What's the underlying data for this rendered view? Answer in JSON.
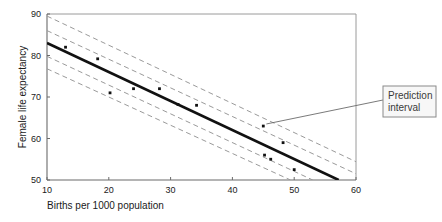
{
  "chart_data": {
    "type": "scatter",
    "title": "",
    "xlabel": "Births per 1000 population",
    "ylabel": "Female life expectancy",
    "xlim": [
      10,
      60
    ],
    "ylim": [
      50,
      90
    ],
    "xticks": [
      10,
      20,
      30,
      40,
      50,
      60
    ],
    "xtick_labels": [
      "10",
      "20",
      "30",
      "40",
      "50",
      "60"
    ],
    "yticks": [
      50,
      60,
      70,
      80,
      90
    ],
    "ytick_labels": [
      "50",
      "60",
      "70",
      "80",
      "90"
    ],
    "grid": false,
    "legend_position": "none",
    "points": [
      {
        "x": 13.0,
        "y": 82.0
      },
      {
        "x": 18.2,
        "y": 79.2
      },
      {
        "x": 20.2,
        "y": 71.0
      },
      {
        "x": 24.0,
        "y": 72.0
      },
      {
        "x": 28.2,
        "y": 72.0
      },
      {
        "x": 31.2,
        "y": 68.2
      },
      {
        "x": 34.2,
        "y": 68.0
      },
      {
        "x": 45.0,
        "y": 63.0
      },
      {
        "x": 45.2,
        "y": 56.0
      },
      {
        "x": 46.2,
        "y": 55.0
      },
      {
        "x": 48.2,
        "y": 59.0
      },
      {
        "x": 50.0,
        "y": 52.5
      }
    ],
    "series": [
      {
        "name": "Regression line",
        "style": "solid",
        "x": [
          10,
          57.2
        ],
        "values": [
          83.0,
          50.0
        ]
      },
      {
        "name": "Prediction interval upper",
        "style": "dashed",
        "x": [
          10,
          60
        ],
        "values": [
          89.5,
          54.4
        ]
      },
      {
        "name": "Confidence interval upper",
        "style": "dashed",
        "x": [
          10,
          60
        ],
        "values": [
          86.0,
          51.5
        ]
      },
      {
        "name": "Confidence interval lower",
        "style": "dashed",
        "x": [
          10,
          53.0
        ],
        "values": [
          79.8,
          50.0
        ]
      },
      {
        "name": "Prediction interval lower",
        "style": "dashed",
        "x": [
          10,
          49.4
        ],
        "values": [
          76.8,
          50.0
        ]
      }
    ],
    "annotations": [
      {
        "name": "prediction-interval",
        "text_line_1": "Prediction",
        "text_line_2": "interval",
        "target_x": 45.5,
        "target_y": 63.5
      }
    ],
    "colors": {
      "line": "#111111",
      "band": "#9a9a9a",
      "point": "#111111",
      "axis": "#9a9a9a",
      "text": "#1a1a1a",
      "annotation_border": "#8a8a8a",
      "annotation_fill": "#f7f7f7"
    }
  }
}
